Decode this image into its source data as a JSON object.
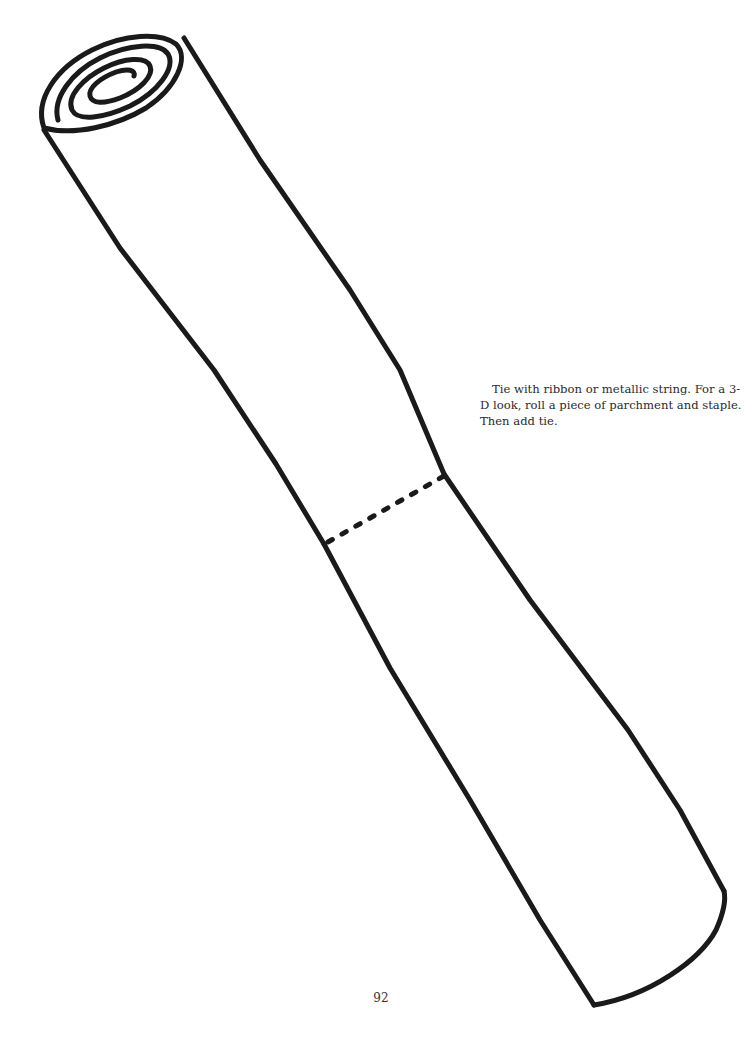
{
  "page": {
    "caption": "Tie with ribbon or metallic string. For a 3-D look, roll a piece of parchment and staple. Then add tie.",
    "page_number": "92"
  },
  "illustration": {
    "subject": "rolled scroll outline",
    "line_color": "#1a1a1a",
    "background": "#ffffff"
  }
}
